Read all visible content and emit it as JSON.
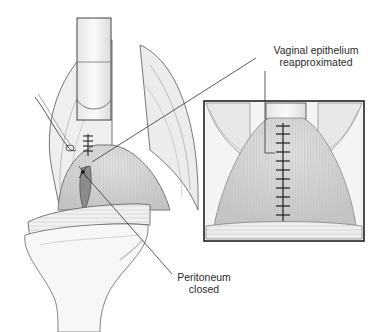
{
  "figure": {
    "labels": {
      "vaginal_epithelium_line1": "Vaginal epithelium",
      "vaginal_epithelium_line2": "reapproximated",
      "peritoneum_line1": "Peritoneum",
      "peritoneum_line2": "closed"
    },
    "colors": {
      "line": "#3a3a3a",
      "tissue_light": "#f2f2f2",
      "tissue_mid": "#d8d8d8",
      "tissue_dark": "#9a9a9a",
      "inset_border": "#222222"
    },
    "inset": {
      "suture_count": 11
    },
    "main_view": {
      "suture_count": 4
    }
  }
}
